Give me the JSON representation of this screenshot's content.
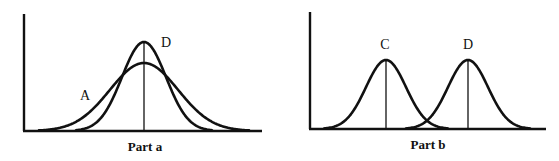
{
  "figure": {
    "panels": [
      {
        "id": "part-a",
        "caption": "Part a",
        "curves": [
          {
            "label": "A",
            "description": "wider, lower normal curve",
            "mean_x": 144,
            "peak_y": 63,
            "sigma_px": 34
          },
          {
            "label": "B",
            "description": "narrower, taller normal curve",
            "mean_x": 144,
            "peak_y": 42,
            "sigma_px": 22
          }
        ],
        "note": "Both curves share the same mean (single vertical line at center)"
      },
      {
        "id": "part-b",
        "caption": "Part b",
        "curves": [
          {
            "label": "C",
            "description": "normal curve, left",
            "mean_x": 386,
            "peak_y": 60,
            "sigma_px": 20
          },
          {
            "label": "D",
            "description": "normal curve, right",
            "mean_x": 468,
            "peak_y": 60,
            "sigma_px": 20
          }
        ],
        "note": "Equal spread, different means (two vertical lines)"
      }
    ],
    "colors": {
      "stroke": "#111111",
      "background": "#ffffff"
    }
  }
}
